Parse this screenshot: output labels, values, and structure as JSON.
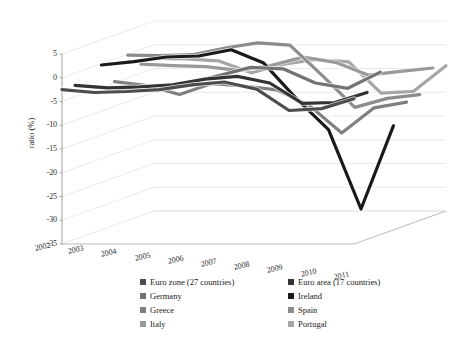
{
  "chart_data": {
    "type": "line",
    "render": "3d-perspective-line",
    "title": "",
    "subtitle": "",
    "xlabel": "",
    "ylabel": "ratio (%)",
    "x": [
      2002,
      2003,
      2004,
      2005,
      2006,
      2007,
      2008,
      2009,
      2010,
      2011
    ],
    "categories": [
      "2002",
      "2003",
      "2004",
      "2005",
      "2006",
      "2007",
      "2008",
      "2009",
      "2010",
      "2011"
    ],
    "ylim": [
      -35,
      5
    ],
    "yticks": [
      5,
      0,
      -5,
      -10,
      -15,
      -20,
      -25,
      -30,
      -35
    ],
    "ytick_labels": [
      "5",
      "0",
      "-5",
      "-10",
      "-15",
      "-20",
      "-25",
      "-30",
      "-35"
    ],
    "grid": true,
    "legend_position": "bottom",
    "legend_columns": 2,
    "series": [
      {
        "name": "Euro zone (27 countries)",
        "color": "#4d4d4d",
        "values": [
          -2.5,
          -3.1,
          -2.9,
          -2.5,
          -1.5,
          -0.9,
          -2.4,
          -6.9,
          -6.5,
          -4.4
        ]
      },
      {
        "name": "Euro area (17 countries)",
        "color": "#333333",
        "values": [
          -2.6,
          -3.1,
          -2.9,
          -2.5,
          -1.3,
          -0.7,
          -2.1,
          -6.4,
          -6.2,
          -4.1
        ]
      },
      {
        "name": "Germany",
        "color": "#737373",
        "values": [
          -3.8,
          -4.2,
          -3.8,
          -3.3,
          -1.6,
          0.2,
          -0.1,
          -3.1,
          -4.2,
          -0.8
        ]
      },
      {
        "name": "Ireland",
        "color": "#1a1a1a",
        "values": [
          -0.3,
          0.4,
          1.4,
          1.6,
          2.9,
          0.1,
          -7.3,
          -13.9,
          -30.6,
          -13.1
        ]
      },
      {
        "name": "Greece",
        "color": "#808080",
        "values": [
          -4.8,
          -5.6,
          -7.5,
          -5.2,
          -5.7,
          -6.5,
          -9.8,
          -15.6,
          -10.3,
          -9.1
        ]
      },
      {
        "name": "Spain",
        "color": "#8c8c8c",
        "values": [
          -0.2,
          -0.3,
          -0.1,
          1.3,
          2.4,
          1.9,
          -4.5,
          -11.2,
          -9.3,
          -8.5
        ]
      },
      {
        "name": "Italy",
        "color": "#999999",
        "values": [
          -3.1,
          -3.4,
          -3.6,
          -4.4,
          -3.4,
          -1.6,
          -2.7,
          -5.4,
          -4.6,
          -3.9
        ]
      },
      {
        "name": "Portugal",
        "color": "#a6a6a6",
        "values": [
          -2.9,
          -3.0,
          -3.4,
          -5.9,
          -4.1,
          -3.1,
          -3.6,
          -10.2,
          -9.8,
          -4.4
        ]
      }
    ]
  },
  "axes": {
    "y_title": "ratio (%)",
    "y_tick_labels": [
      "5",
      "0",
      "-5",
      "-10",
      "-15",
      "-20",
      "-25",
      "-30",
      "-35"
    ],
    "x_tick_labels": [
      "2002",
      "2003",
      "2004",
      "2005",
      "2006",
      "2007",
      "2008",
      "2009",
      "2010",
      "2011"
    ]
  },
  "legend": {
    "left_column": [
      {
        "label": "Euro zone (27 countries)",
        "color": "#4d4d4d"
      },
      {
        "label": "Germany",
        "color": "#737373"
      },
      {
        "label": "Greece",
        "color": "#808080"
      },
      {
        "label": "Italy",
        "color": "#999999"
      }
    ],
    "right_column": [
      {
        "label": "Euro area (17 countries)",
        "color": "#333333"
      },
      {
        "label": "Ireland",
        "color": "#1a1a1a"
      },
      {
        "label": "Spain",
        "color": "#8c8c8c"
      },
      {
        "label": "Portugal",
        "color": "#a6a6a6"
      }
    ]
  },
  "colors": {
    "background": "#ffffff",
    "grid": "#d9d9d9",
    "axis": "#8c8c8c",
    "text": "#1a1a1a"
  }
}
